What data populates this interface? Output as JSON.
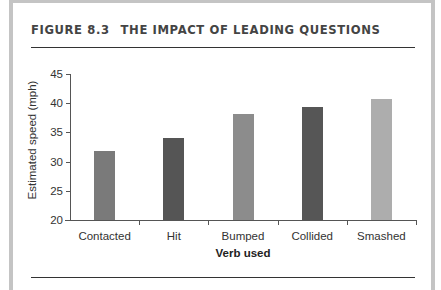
{
  "figure": {
    "number": "FIGURE 8.3",
    "title": "THE IMPACT OF LEADING QUESTIONS"
  },
  "chart_data": {
    "type": "bar",
    "title": "THE IMPACT OF LEADING QUESTIONS",
    "xlabel": "Verb used",
    "ylabel": "Estimated speed (mph)",
    "categories": [
      "Contacted",
      "Hit",
      "Bumped",
      "Collided",
      "Smashed"
    ],
    "values": [
      31.8,
      34.0,
      38.1,
      39.3,
      40.8
    ],
    "ylim": [
      20,
      45
    ],
    "yticks": [
      20,
      25,
      30,
      35,
      40,
      45
    ],
    "bar_colors": [
      "#7a7a7a",
      "#555555",
      "#8c8c8c",
      "#565656",
      "#adadad"
    ],
    "grid": false,
    "legend": null
  }
}
